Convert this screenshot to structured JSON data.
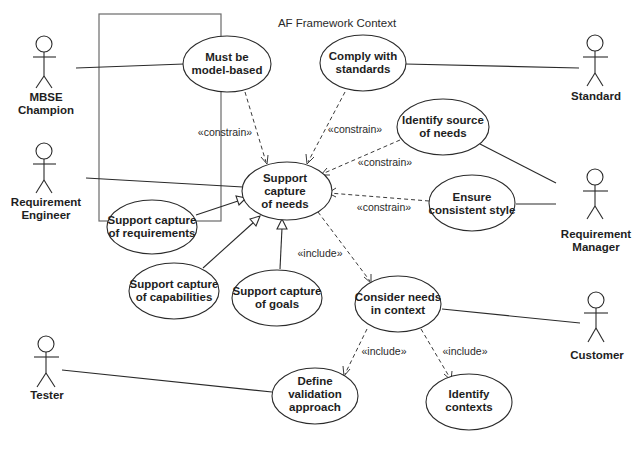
{
  "diagram": {
    "title": "AF Framework Context",
    "actors": [
      {
        "id": "mbse",
        "label_lines": [
          "MBSE",
          "Champion"
        ]
      },
      {
        "id": "reqeng",
        "label_lines": [
          "Requirement",
          "Engineer"
        ]
      },
      {
        "id": "tester",
        "label_lines": [
          "Tester"
        ]
      },
      {
        "id": "standard",
        "label_lines": [
          "Standard"
        ]
      },
      {
        "id": "reqmgr",
        "label_lines": [
          "Requirement",
          "Manager"
        ]
      },
      {
        "id": "customer",
        "label_lines": [
          "Customer"
        ]
      }
    ],
    "use_cases": [
      {
        "id": "model",
        "label_lines": [
          "Must be",
          "model-based"
        ]
      },
      {
        "id": "comply",
        "label_lines": [
          "Comply with",
          "standards"
        ]
      },
      {
        "id": "source",
        "label_lines": [
          "Identify source",
          "of needs"
        ]
      },
      {
        "id": "needs",
        "label_lines": [
          "Support",
          "capture",
          "of needs"
        ]
      },
      {
        "id": "style",
        "label_lines": [
          "Ensure",
          "consistent style"
        ]
      },
      {
        "id": "reqs",
        "label_lines": [
          "Support capture",
          "of requirements"
        ]
      },
      {
        "id": "caps",
        "label_lines": [
          "Support capture",
          "of capabilities"
        ]
      },
      {
        "id": "goals",
        "label_lines": [
          "Support capture",
          "of goals"
        ]
      },
      {
        "id": "context",
        "label_lines": [
          "Consider needs",
          "in context"
        ]
      },
      {
        "id": "validation",
        "label_lines": [
          "Define",
          "validation",
          "approach"
        ]
      },
      {
        "id": "contexts",
        "label_lines": [
          "Identify",
          "contexts"
        ]
      }
    ],
    "stereotypes": {
      "constrain": "«constrain»",
      "include": "«include»"
    },
    "relationships": [
      {
        "from": "mbse",
        "to": "model",
        "type": "association"
      },
      {
        "from": "reqeng",
        "to": "needs",
        "type": "association"
      },
      {
        "from": "tester",
        "to": "validation",
        "type": "association"
      },
      {
        "from": "standard",
        "to": "comply",
        "type": "association"
      },
      {
        "from": "reqmgr",
        "to": "source",
        "type": "association"
      },
      {
        "from": "reqmgr",
        "to": "style",
        "type": "association"
      },
      {
        "from": "customer",
        "to": "context",
        "type": "association"
      },
      {
        "from": "model",
        "to": "needs",
        "type": "constrain"
      },
      {
        "from": "comply",
        "to": "needs",
        "type": "constrain"
      },
      {
        "from": "source",
        "to": "needs",
        "type": "constrain"
      },
      {
        "from": "style",
        "to": "needs",
        "type": "constrain"
      },
      {
        "from": "reqs",
        "to": "needs",
        "type": "generalization"
      },
      {
        "from": "caps",
        "to": "needs",
        "type": "generalization"
      },
      {
        "from": "goals",
        "to": "needs",
        "type": "generalization"
      },
      {
        "from": "needs",
        "to": "context",
        "type": "include"
      },
      {
        "from": "context",
        "to": "validation",
        "type": "include"
      },
      {
        "from": "context",
        "to": "contexts",
        "type": "include"
      }
    ]
  }
}
